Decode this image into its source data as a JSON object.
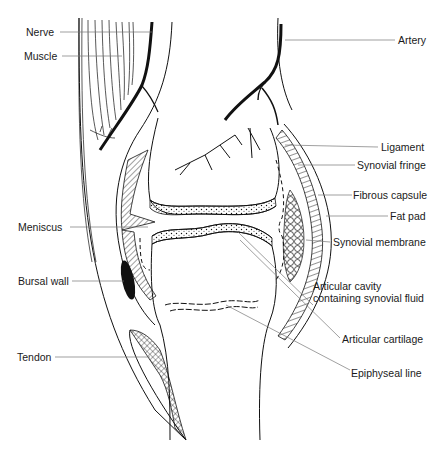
{
  "diagram": {
    "colors": {
      "ink": "#111111",
      "leader": "#777777",
      "background": "#ffffff"
    },
    "labels_left": [
      {
        "id": "nerve",
        "text": "Nerve"
      },
      {
        "id": "muscle",
        "text": "Muscle"
      },
      {
        "id": "meniscus",
        "text": "Meniscus"
      },
      {
        "id": "bursal_wall",
        "text": "Bursal wall"
      },
      {
        "id": "tendon",
        "text": "Tendon"
      }
    ],
    "labels_right": [
      {
        "id": "artery",
        "text": "Artery"
      },
      {
        "id": "ligament",
        "text": "Ligament"
      },
      {
        "id": "synovial_fringe",
        "text": "Synovial fringe"
      },
      {
        "id": "fibrous_capsule",
        "text": "Fibrous capsule"
      },
      {
        "id": "fat_pad",
        "text": "Fat pad"
      },
      {
        "id": "synovial_membrane",
        "text": "Synovial membrane"
      },
      {
        "id": "articular_cavity",
        "text": "Articular cavity\ncontaining synovial fluid"
      },
      {
        "id": "articular_cartilage",
        "text": "Articular cartilage"
      },
      {
        "id": "epiphyseal_line",
        "text": "Epiphyseal line"
      }
    ]
  }
}
